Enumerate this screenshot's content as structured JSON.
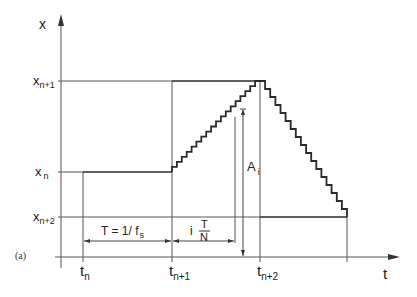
{
  "figure": {
    "panel_label": "(a)",
    "colors": {
      "line": "#2a2a2a",
      "thin": "#555555",
      "background": "#ffffff"
    },
    "axes": {
      "y_label": "x",
      "x_label": "t",
      "y_levels": [
        {
          "name": "x_n+1",
          "base": "x",
          "sub": "n+1"
        },
        {
          "name": "x_n",
          "base": "x",
          "sub": "n"
        },
        {
          "name": "x_n+2",
          "base": "x",
          "sub": "n+2"
        }
      ],
      "x_ticks": [
        {
          "name": "t_n",
          "base": "t",
          "sub": "n"
        },
        {
          "name": "t_n+1",
          "base": "t",
          "sub": "n+1"
        },
        {
          "name": "t_n+2",
          "base": "t",
          "sub": "n+2"
        }
      ]
    },
    "annotations": {
      "period": "T = 1/ f",
      "period_sub": "s",
      "step_i": "i",
      "step_num": "T",
      "step_den": "N",
      "amplitude": "A",
      "amplitude_sub": "i"
    },
    "staircase": {
      "steps_up": 18,
      "steps_down": 17
    }
  }
}
